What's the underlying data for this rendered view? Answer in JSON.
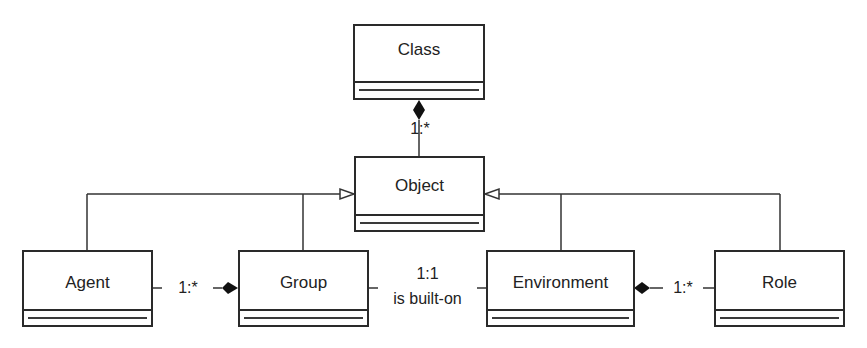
{
  "diagram": {
    "type": "UML class diagram",
    "classes": [
      {
        "id": "class",
        "name": "Class"
      },
      {
        "id": "object",
        "name": "Object"
      },
      {
        "id": "agent",
        "name": "Agent"
      },
      {
        "id": "group",
        "name": "Group"
      },
      {
        "id": "environment",
        "name": "Environment"
      },
      {
        "id": "role",
        "name": "Role"
      }
    ],
    "relations": [
      {
        "from": "class",
        "to": "object",
        "kind": "composition",
        "multiplicity": "1:*"
      },
      {
        "from": "agent",
        "to": "object",
        "kind": "generalization"
      },
      {
        "from": "group",
        "to": "object",
        "kind": "generalization"
      },
      {
        "from": "environment",
        "to": "object",
        "kind": "generalization"
      },
      {
        "from": "role",
        "to": "object",
        "kind": "generalization"
      },
      {
        "from": "group",
        "to": "agent",
        "kind": "composition",
        "multiplicity": "1:*"
      },
      {
        "from": "group",
        "to": "environment",
        "kind": "association",
        "multiplicity": "1:1",
        "label": "is built-on"
      },
      {
        "from": "environment",
        "to": "role",
        "kind": "composition",
        "multiplicity": "1:*"
      }
    ],
    "labels": {
      "class_object_mult": "1:*",
      "agent_group_mult": "1:*",
      "group_env_mult": "1:1",
      "group_env_label": "is built-on",
      "env_role_mult": "1:*"
    }
  }
}
